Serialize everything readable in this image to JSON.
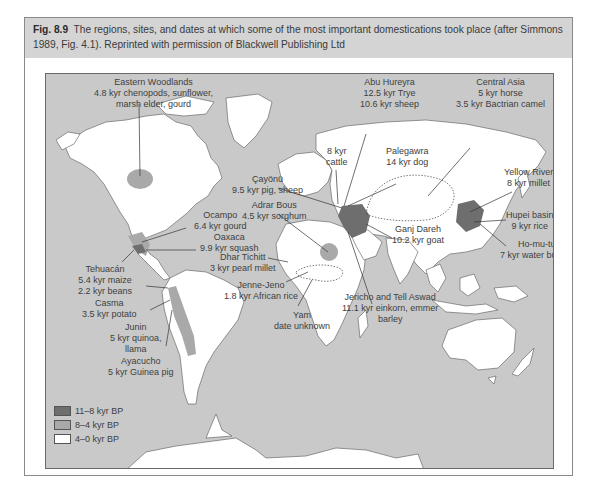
{
  "page_header_fragment": "Origins of plant and animal domestication...",
  "figure": {
    "number": "Fig. 8.9",
    "caption": "The regions, sites, and dates at which some of the most important domestications took place (after Simmons 1989, Fig. 4.1). Reprinted with permission of Blackwell Publishing Ltd"
  },
  "colors": {
    "ocean": "#c9c9c9",
    "land": "#ffffff",
    "period_11_8": "#6e6e6e",
    "period_8_4": "#a9a9a9",
    "period_4_0": "#ffffff",
    "caption_band": "#d4d4d4"
  },
  "labels": {
    "eastern_woodlands": [
      "Eastern Woodlands",
      "4.8 kyr chenopods, sunflower,",
      "marsh elder, gourd"
    ],
    "abu_hureyra": [
      "Abu Hureyra",
      "12.5 kyr Trye",
      "10.6 kyr sheep"
    ],
    "central_asia": [
      "Central Asia",
      "5 kyr horse",
      "3.5 kyr Bactrian camel"
    ],
    "cattle": [
      "8 kyr",
      "cattle"
    ],
    "palegawra": [
      "Palegawra",
      "14 kyr dog"
    ],
    "cayonu": [
      "Çayönü",
      "9.5 kyr pig, sheep"
    ],
    "yellow_river": [
      "Yellow River",
      "8 kyr millet"
    ],
    "adrar_bous": [
      "Adrar Bous",
      "4.5 kyr sorghum"
    ],
    "ocampo": [
      "Ocampo",
      "6.4 kyr gourd"
    ],
    "oaxaca": [
      "Oaxaca",
      "9.9 kyr squash"
    ],
    "hupei": [
      "Hupei basin",
      "9 kyr rice"
    ],
    "ganj_dareh": [
      "Ganj Dareh",
      "10.2 kyr goat"
    ],
    "ho_mu_tu": [
      "Ho-mu-tu",
      "7 kyr water buffalo"
    ],
    "dhar_tichitt": [
      "Dhar Tichitt",
      "3 kyr pearl millet"
    ],
    "tehuacan": [
      "Tehuacán",
      "5.4 kyr maize",
      "2.2 kyr beans"
    ],
    "jenne_jeno": [
      "Jenne-Jeno",
      "1.8 kyr African rice"
    ],
    "jericho": [
      "Jericho and Tell Aswad",
      "11.1 kyr einkorn, emmer",
      "barley"
    ],
    "yam": [
      "Yam",
      "date unknown"
    ],
    "casma": [
      "Casma",
      "3.5 kyr potato"
    ],
    "junin": [
      "Junin",
      "5 kyr quinoa,",
      "llama"
    ],
    "ayacucho": [
      "Ayacucho",
      "5 kyr Guinea pig"
    ]
  },
  "legend": [
    {
      "label": "11–8 kyr BP",
      "color": "#6e6e6e"
    },
    {
      "label": "8–4 kyr BP",
      "color": "#a9a9a9"
    },
    {
      "label": "4–0 kyr BP",
      "color": "#ffffff"
    }
  ]
}
